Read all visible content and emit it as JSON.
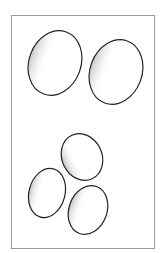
{
  "illustration": {
    "subject": "eggs",
    "count": 5,
    "frame_color": "#9a9a9a",
    "outline_color": "#222222",
    "shade_color": "#8a8a8a"
  }
}
